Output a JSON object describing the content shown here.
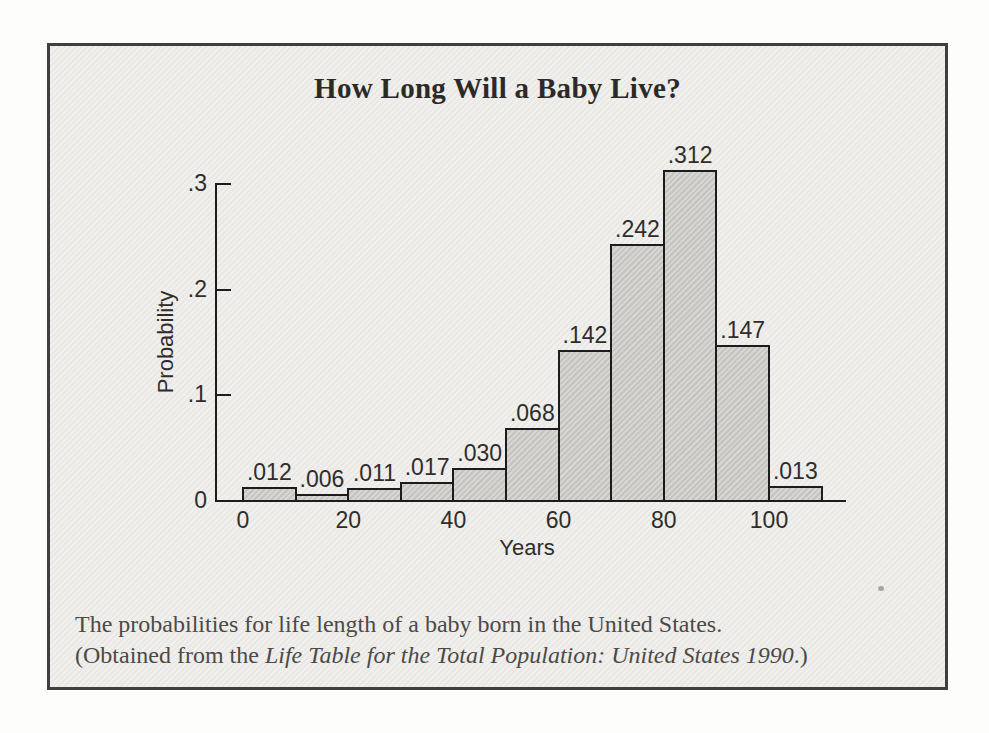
{
  "figure": {
    "caption_line1": "The probabilities for life length of a baby born in the United States.",
    "caption_line2_prefix": "(Obtained from the ",
    "caption_line2_italic": "Life Table for the Total Population: United States 1990",
    "caption_line2_suffix": ".)"
  },
  "chart_data": {
    "type": "bar",
    "title": "How Long Will a Baby Live?",
    "xlabel": "Years",
    "ylabel": "Probability",
    "bin_edges_years": [
      0,
      10,
      20,
      30,
      40,
      50,
      60,
      70,
      80,
      90,
      100,
      110
    ],
    "values": [
      0.012,
      0.006,
      0.011,
      0.017,
      0.03,
      0.068,
      0.142,
      0.242,
      0.312,
      0.147,
      0.013
    ],
    "bar_labels": [
      ".012",
      ".006",
      ".011",
      ".017",
      ".030",
      ".068",
      ".142",
      ".242",
      ".312",
      ".147",
      ".013"
    ],
    "x_ticks": {
      "values": [
        0,
        20,
        40,
        60,
        80,
        100
      ],
      "labels": [
        "0",
        "20",
        "40",
        "60",
        "80",
        "100"
      ]
    },
    "y_ticks": {
      "values": [
        0,
        0.1,
        0.2,
        0.3
      ],
      "labels": [
        "0",
        ".1",
        ".2",
        ".3"
      ]
    },
    "xlim": [
      0,
      120
    ],
    "ylim": [
      0,
      0.3
    ],
    "grid": false,
    "legend": false
  },
  "colors": {
    "page_background": "#fdfdfc",
    "paper": "#ecebe8",
    "box_border": "#3f3f3f",
    "axis": "#1c1c1c",
    "bar_fill": "#cbcac7",
    "bar_edge": "#1c1c1c",
    "title_text": "#2b2a28",
    "caption_text": "#4c4a47"
  }
}
